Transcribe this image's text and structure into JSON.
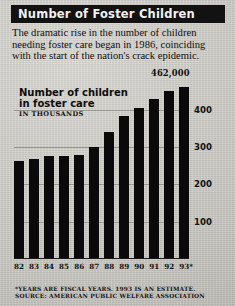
{
  "title": "Number of Foster Children",
  "deck": "The dramatic rise in the number of children needing foster care began in 1986, coinciding with the start of the nation's crack epidemic.",
  "chart_label_line1": "Number of children",
  "chart_label_line2": "in foster care",
  "units": "IN THOUSANDS",
  "callout": "462,000",
  "footnotes": [
    "*YEARS ARE FISCAL YEARS. 1993 IS AN ESTIMATE.",
    "SOURCE: AMERICAN PUBLIC WELFARE ASSOCIATION"
  ],
  "colors": {
    "bar": "#0a0a0a",
    "banner": "#121212",
    "banner_text": "#f2f1ee",
    "paper": "#cfcdc8",
    "gridline": "#8e8c86"
  },
  "chart_data": {
    "type": "bar",
    "title": "Number of children in foster care",
    "xlabel": "",
    "ylabel": "IN THOUSANDS",
    "categories": [
      "82",
      "83",
      "84",
      "85",
      "86",
      "87",
      "88",
      "89",
      "90",
      "91",
      "92",
      "93*"
    ],
    "values": [
      262,
      268,
      276,
      276,
      280,
      300,
      340,
      383,
      406,
      429,
      450,
      462
    ],
    "ylim": [
      0,
      480
    ],
    "yticks": [
      100,
      200,
      300,
      400
    ],
    "ytick_labels": [
      "100",
      "200",
      "300",
      "400"
    ],
    "grid": true,
    "legend": "none",
    "annotations": [
      {
        "category": "93*",
        "text": "462,000",
        "value": 462
      }
    ]
  }
}
